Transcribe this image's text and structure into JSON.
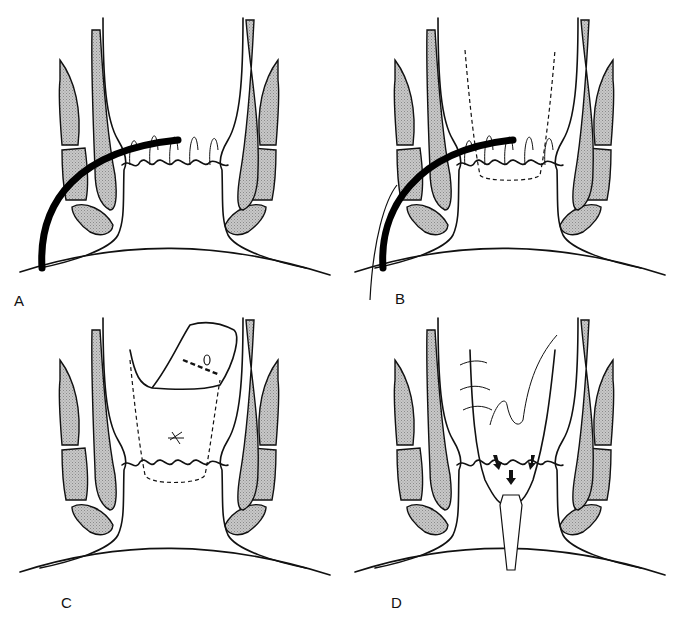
{
  "figure": {
    "type": "medical line-art illustration",
    "panels": [
      {
        "id": "A",
        "label": "A",
        "description": "Curved probe inserted through tissue toward the crypts at the dentate line"
      },
      {
        "id": "B",
        "label": "B",
        "description": "Probe in place with dashed outline of tissue to be excised; second instrument alongside"
      },
      {
        "id": "C",
        "label": "C",
        "description": "Flap of mucosa mobilized with suture placed; dashed outline of excised area"
      },
      {
        "id": "D",
        "label": "D",
        "description": "Flap advanced and sutured; arrows indicating drainage toward a tube"
      }
    ]
  },
  "colors": {
    "line": "#111111",
    "muscle_fill": "#bdbdbd",
    "background": "#ffffff"
  }
}
